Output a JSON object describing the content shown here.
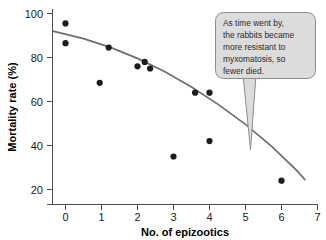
{
  "chart_data": {
    "type": "scatter",
    "title": "",
    "xlabel": "No. of epizootics",
    "ylabel": "Mortality rate (%)",
    "xlim": [
      -0.35,
      7.0
    ],
    "ylim": [
      16,
      101
    ],
    "grid": false,
    "legend": null,
    "x_ticks": [
      "0",
      "1",
      "2",
      "3",
      "4",
      "5",
      "6",
      "7"
    ],
    "x_tick_values": [
      0,
      1,
      2,
      3,
      4,
      5,
      6,
      7
    ],
    "y_ticks": [
      "20",
      "40",
      "60",
      "80",
      "100"
    ],
    "y_tick_values": [
      20,
      40,
      60,
      80,
      100
    ],
    "points": [
      {
        "x": 0.0,
        "y": 95.5
      },
      {
        "x": 0.0,
        "y": 86.5
      },
      {
        "x": 0.95,
        "y": 68.5
      },
      {
        "x": 1.2,
        "y": 84.5
      },
      {
        "x": 2.0,
        "y": 76.0
      },
      {
        "x": 2.2,
        "y": 78.0
      },
      {
        "x": 2.35,
        "y": 75.0
      },
      {
        "x": 3.0,
        "y": 35.0
      },
      {
        "x": 3.6,
        "y": 64.0
      },
      {
        "x": 4.0,
        "y": 64.0
      },
      {
        "x": 4.0,
        "y": 42.0
      },
      {
        "x": 6.0,
        "y": 24.0
      }
    ],
    "trend": {
      "name": "fitted curve",
      "x": [
        -0.35,
        0.5,
        1.25,
        2.0,
        2.75,
        3.5,
        4.25,
        5.0,
        5.75,
        6.4,
        6.65
      ],
      "y": [
        92.0,
        88.6,
        84.6,
        79.6,
        73.6,
        66.6,
        58.6,
        49.6,
        39.3,
        29.0,
        24.5
      ]
    },
    "annotations": [
      {
        "name": "callout",
        "lines": [
          "As time went by,",
          "the rabbits became",
          "more resistant to",
          "myxomatosis, so",
          "fewer died."
        ],
        "points_to": {
          "x": 5.15,
          "y": 40.0
        }
      }
    ],
    "colors": {
      "point": "#1c1c1c",
      "trend": "#6e6e6e",
      "axis": "#4d4d4d",
      "callout_fill": "#dcdcdc",
      "callout_border": "#8c8c8c",
      "text": "#1a1a1a"
    }
  }
}
